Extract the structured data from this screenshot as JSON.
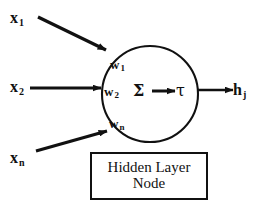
{
  "diagram": {
    "title": "Hidden Layer Node",
    "type": "neural-network-node",
    "colors": {
      "stroke": "#111111",
      "background": "#ffffff",
      "text": "#111111"
    },
    "inputs": [
      {
        "id": "x1",
        "base": "x",
        "sub": "1",
        "weight_base": "w",
        "weight_sub": "1"
      },
      {
        "id": "x2",
        "base": "x",
        "sub": "2",
        "weight_base": "w",
        "weight_sub": "2"
      },
      {
        "id": "xn",
        "base": "x",
        "sub": "n",
        "weight_base": "w",
        "weight_sub": "n"
      }
    ],
    "body": {
      "summation_symbol": "Σ",
      "transfer_symbol": "τ",
      "arrow_symbol": "→"
    },
    "output": {
      "id": "hj",
      "base": "h",
      "sub": "j"
    },
    "caption": {
      "line1": "Hidden Layer",
      "line2": "Node"
    }
  }
}
